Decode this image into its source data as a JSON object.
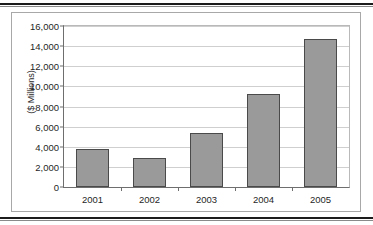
{
  "chart_data": {
    "type": "bar",
    "title": "",
    "subtitle": "",
    "xlabel": "",
    "ylabel": "($ Millions)",
    "categories": [
      "2001",
      "2002",
      "2003",
      "2004",
      "2005"
    ],
    "values": [
      3730,
      2850,
      5400,
      9230,
      14720
    ],
    "series": [
      {
        "name": "",
        "values": [
          3730,
          2850,
          5400,
          9230,
          14720
        ]
      }
    ],
    "ylim": [
      0,
      16000
    ],
    "ytick_values": [
      0,
      2000,
      4000,
      6000,
      8000,
      10000,
      12000,
      14000,
      16000
    ],
    "ytick_labels": [
      "0",
      "2,000",
      "4,000",
      "6,000",
      "8,000",
      "10,000",
      "12,000",
      "14,000",
      "16,000"
    ],
    "grid": "horizontal",
    "legend": "none",
    "bar_color": "#9a9a9a",
    "bar_border_color": "#4a4a4a",
    "gridline_color": "#cfcfcf",
    "axis_color": "#6e6e6e",
    "plot_background": "#ffffff",
    "frame_border_color": "#a8a8a8"
  }
}
